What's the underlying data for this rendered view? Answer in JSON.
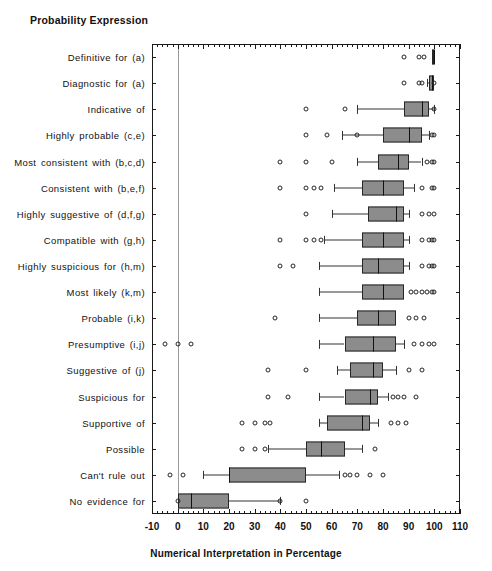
{
  "chart_data": {
    "type": "box",
    "title": "Probability Expression",
    "xlabel": "Numerical Interpretation in Percentage",
    "ylabel": "Probability Expression",
    "xlim": [
      -10,
      110
    ],
    "xticks": [
      -10,
      0,
      10,
      20,
      30,
      40,
      50,
      60,
      70,
      80,
      90,
      100,
      110
    ],
    "xticklabels": [
      "-10",
      "0",
      "10",
      "20",
      "30",
      "40",
      "50",
      "60",
      "70",
      "80",
      "90",
      "100",
      "110"
    ],
    "grid": "vertical-line-at-zero",
    "legend": "none",
    "orientation": "horizontal",
    "categories": [
      "Definitive for (a)",
      "Diagnostic for (a)",
      "Indicative of",
      "Highly probable (c,e)",
      "Most consistent with (b,c,d)",
      "Consistent with (b,e,f)",
      "Highly suggestive of (d,f,g)",
      "Compatible with (g,h)",
      "Highly suspicious for (h,m)",
      "Most likely (k,m)",
      "Probable (i,k)",
      "Presumptive (i,j)",
      "Suggestive of (j)",
      "Suspicious for",
      "Supportive of",
      "Possible",
      "Can't rule out",
      "No evidence for"
    ],
    "boxes": [
      {
        "label": "Definitive for (a)",
        "whisker_low": 99,
        "q1": 99,
        "median": 100,
        "q3": 100,
        "whisker_high": 100,
        "outliers": [
          88,
          94,
          96
        ]
      },
      {
        "label": "Diagnostic for (a)",
        "whisker_low": 97,
        "q1": 98,
        "median": 99,
        "q3": 100,
        "whisker_high": 100,
        "outliers": [
          88,
          94,
          95,
          100
        ]
      },
      {
        "label": "Indicative of",
        "whisker_low": 70,
        "q1": 88,
        "median": 95,
        "q3": 98,
        "whisker_high": 100,
        "outliers": [
          50,
          65,
          100
        ]
      },
      {
        "label": "Highly probable (c,e)",
        "whisker_low": 64,
        "q1": 80,
        "median": 90,
        "q3": 95,
        "whisker_high": 98,
        "outliers": [
          50,
          58,
          70,
          99,
          100
        ]
      },
      {
        "label": "Most consistent with (b,c,d)",
        "whisker_low": 70,
        "q1": 78,
        "median": 86,
        "q3": 90,
        "whisker_high": 95,
        "outliers": [
          40,
          50,
          60,
          97,
          99,
          100
        ]
      },
      {
        "label": "Consistent with (b,e,f)",
        "whisker_low": 61,
        "q1": 72,
        "median": 80,
        "q3": 88,
        "whisker_high": 92,
        "outliers": [
          40,
          50,
          53,
          56,
          95,
          99,
          100
        ]
      },
      {
        "label": "Highly suggestive of (d,f,g)",
        "whisker_low": 60,
        "q1": 74,
        "median": 85,
        "q3": 88,
        "whisker_high": 90,
        "outliers": [
          50,
          95,
          98,
          100
        ]
      },
      {
        "label": "Compatible with (g,h)",
        "whisker_low": 57,
        "q1": 72,
        "median": 80,
        "q3": 88,
        "whisker_high": 90,
        "outliers": [
          40,
          50,
          53,
          56,
          95,
          98,
          99,
          100
        ]
      },
      {
        "label": "Highly suspicious for (h,m)",
        "whisker_low": 55,
        "q1": 72,
        "median": 78,
        "q3": 88,
        "whisker_high": 90,
        "outliers": [
          40,
          45,
          95,
          98,
          99,
          100
        ]
      },
      {
        "label": "Most likely (k,m)",
        "whisker_low": 55,
        "q1": 72,
        "median": 80,
        "q3": 88,
        "whisker_high": 88,
        "outliers": [
          91,
          93,
          95,
          97,
          99,
          100
        ]
      },
      {
        "label": "Probable (i,k)",
        "whisker_low": 55,
        "q1": 70,
        "median": 78,
        "q3": 85,
        "whisker_high": 85,
        "outliers": [
          38,
          90,
          93,
          96
        ]
      },
      {
        "label": "Presumptive (i,j)",
        "whisker_low": 55,
        "q1": 65,
        "median": 76,
        "q3": 85,
        "whisker_high": 88,
        "outliers": [
          -5,
          0,
          5,
          92,
          95,
          98,
          100
        ]
      },
      {
        "label": "Suggestive of (j)",
        "whisker_low": 62,
        "q1": 67,
        "median": 76,
        "q3": 80,
        "whisker_high": 85,
        "outliers": [
          35,
          50,
          90,
          95
        ]
      },
      {
        "label": "Suspicious for",
        "whisker_low": 55,
        "q1": 65,
        "median": 75,
        "q3": 78,
        "whisker_high": 82,
        "outliers": [
          35,
          43,
          84,
          86,
          88,
          93
        ]
      },
      {
        "label": "Supportive of",
        "whisker_low": 55,
        "q1": 58,
        "median": 72,
        "q3": 75,
        "whisker_high": 78,
        "outliers": [
          25,
          30,
          34,
          36,
          83,
          86,
          89
        ]
      },
      {
        "label": "Possible",
        "whisker_low": 35,
        "q1": 50,
        "median": 56,
        "q3": 65,
        "whisker_high": 72,
        "outliers": [
          25,
          30,
          34,
          77
        ]
      },
      {
        "label": "Can't rule out",
        "whisker_low": 10,
        "q1": 20,
        "median": 20,
        "q3": 50,
        "whisker_high": 63,
        "outliers": [
          -3,
          2,
          65,
          67,
          70,
          75,
          80
        ]
      },
      {
        "label": "No evidence for",
        "whisker_low": 0,
        "q1": 0,
        "median": 5,
        "q3": 20,
        "whisker_high": 40,
        "outliers": [
          0,
          40,
          50
        ]
      }
    ]
  }
}
